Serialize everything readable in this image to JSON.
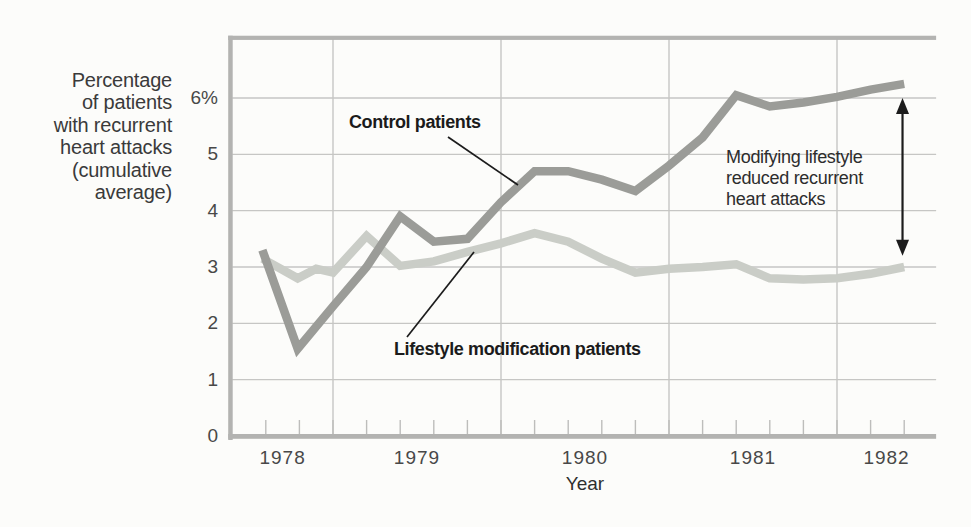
{
  "figure": {
    "background": "#fcfcfa",
    "frame_color": "#b3b3b1",
    "gridline_color": "#c6c6c4",
    "tick_color": "#bdbdbb",
    "callout_color": "#1c1c1c"
  },
  "labels": {
    "y_axis_title": "Percentage\nof patients\nwith recurrent\nheart attacks\n(cumulative\naverage)",
    "x_axis_title": "Year",
    "control_series": "Control patients",
    "lifestyle_series": "Lifestyle modification patients",
    "annotation": "Modifying lifestyle\nreduced recurrent\nheart attacks"
  },
  "chart_data": {
    "type": "line",
    "title": "",
    "xlabel": "Year",
    "ylabel": "Percentage of patients with recurrent heart attacks (cumulative average)",
    "xlim": [
      1978.4,
      1982.59
    ],
    "ylim": [
      0,
      7.07
    ],
    "grid": true,
    "x_ticks": [
      "1978",
      "1979",
      "1980",
      "1981",
      "1982"
    ],
    "minor_ticks": {
      "start": 1978.6,
      "end": 1982.4,
      "step": 0.2
    },
    "y_ticks": [
      {
        "label": "0",
        "value": 0
      },
      {
        "label": "1",
        "value": 1
      },
      {
        "label": "2",
        "value": 2
      },
      {
        "label": "3",
        "value": 3
      },
      {
        "label": "4",
        "value": 4
      },
      {
        "label": "5",
        "value": 5
      },
      {
        "label": "6%",
        "value": 6
      }
    ],
    "series": [
      {
        "name": "Lifestyle modification patients",
        "color": "#cacdc7",
        "points": [
          [
            1978.58,
            3.15
          ],
          [
            1978.79,
            2.8
          ],
          [
            1978.9,
            2.97
          ],
          [
            1979.0,
            2.9
          ],
          [
            1979.2,
            3.55
          ],
          [
            1979.4,
            3.02
          ],
          [
            1979.6,
            3.1
          ],
          [
            1979.8,
            3.27
          ],
          [
            1980.0,
            3.42
          ],
          [
            1980.2,
            3.6
          ],
          [
            1980.4,
            3.45
          ],
          [
            1980.6,
            3.15
          ],
          [
            1980.8,
            2.9
          ],
          [
            1981.0,
            2.97
          ],
          [
            1981.2,
            3.0
          ],
          [
            1981.4,
            3.05
          ],
          [
            1981.6,
            2.8
          ],
          [
            1981.8,
            2.78
          ],
          [
            1982.0,
            2.8
          ],
          [
            1982.2,
            2.88
          ],
          [
            1982.4,
            3.0
          ]
        ]
      },
      {
        "name": "Control patients",
        "color": "#9b9c98",
        "points": [
          [
            1978.58,
            3.3
          ],
          [
            1978.79,
            1.55
          ],
          [
            1979.0,
            2.3
          ],
          [
            1979.2,
            3.0
          ],
          [
            1979.4,
            3.9
          ],
          [
            1979.6,
            3.45
          ],
          [
            1979.8,
            3.5
          ],
          [
            1980.0,
            4.15
          ],
          [
            1980.2,
            4.7
          ],
          [
            1980.4,
            4.7
          ],
          [
            1980.6,
            4.55
          ],
          [
            1980.8,
            4.35
          ],
          [
            1981.0,
            4.8
          ],
          [
            1981.2,
            5.3
          ],
          [
            1981.4,
            6.05
          ],
          [
            1981.6,
            5.85
          ],
          [
            1981.8,
            5.92
          ],
          [
            1982.0,
            6.02
          ],
          [
            1982.2,
            6.15
          ],
          [
            1982.4,
            6.25
          ]
        ]
      }
    ],
    "annotations": [
      {
        "type": "double-arrow",
        "text": "Modifying lifestyle reduced recurrent heart attacks",
        "x": 1982.39,
        "y_from": 3.2,
        "y_to": 6.0
      }
    ]
  }
}
